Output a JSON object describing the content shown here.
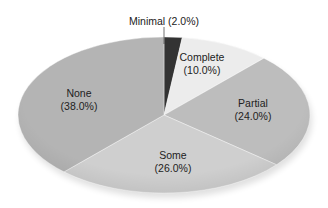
{
  "chart_data": {
    "type": "pie",
    "title": "",
    "categories": [
      "Minimal",
      "Complete",
      "Partial",
      "Some",
      "None"
    ],
    "values": [
      2.0,
      10.0,
      24.0,
      26.0,
      38.0
    ],
    "unit": "%",
    "labels": [
      {
        "name": "Minimal",
        "pct": "(2.0%)",
        "text": "Minimal (2.0%)"
      },
      {
        "name": "Complete",
        "pct": "(10.0%)"
      },
      {
        "name": "Partial",
        "pct": "(24.0%)"
      },
      {
        "name": "Some",
        "pct": "(26.0%)"
      },
      {
        "name": "None",
        "pct": "(38.0%)"
      }
    ],
    "colors": [
      "#333333",
      "#ececec",
      "#bdbdbd",
      "#cfcfcf",
      "#b4b4b4"
    ],
    "start_angle_deg": 90,
    "direction": "clockwise",
    "legend": "none",
    "style": "3d-tilted-ellipse, labels inside slices"
  }
}
